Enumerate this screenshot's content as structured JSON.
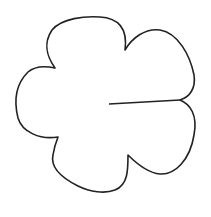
{
  "diagram": {
    "title": "",
    "shape": "flower-outline",
    "petals": 5,
    "stroke_color": "#222222",
    "background_color": "#ffffff"
  }
}
